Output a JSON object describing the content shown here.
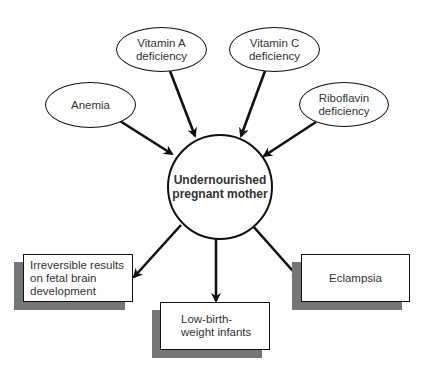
{
  "diagram": {
    "center": {
      "label": "Undernourished\npregnant mother"
    },
    "causes": [
      {
        "id": "vitamin-a",
        "label": "Vitamin A\ndeficiency"
      },
      {
        "id": "vitamin-c",
        "label": "Vitamin C\ndeficiency"
      },
      {
        "id": "anemia",
        "label": "Anemia"
      },
      {
        "id": "riboflavin",
        "label": "Riboflavin\ndeficiency"
      }
    ],
    "effects": [
      {
        "id": "brain",
        "label": "Irreversible results\non fetal brain\ndevelopment"
      },
      {
        "id": "low-birth-weight",
        "label": "Low-birth-\nweight infants"
      },
      {
        "id": "eclampsia",
        "label": "Eclampsia"
      }
    ],
    "colors": {
      "stroke": "#111111",
      "shadow": "#767676",
      "text": "#333333",
      "background": "#ffffff"
    }
  }
}
